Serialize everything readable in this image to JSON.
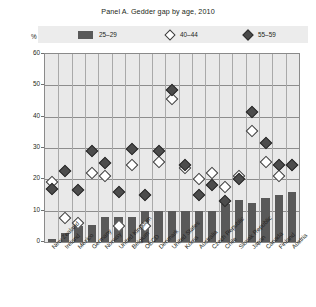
{
  "chart": {
    "title": "Panel A. Gedder gap by age, 2010",
    "unit_label": "%"
  },
  "legend": {
    "items": [
      {
        "label": "25–29",
        "marker": "filled-square",
        "color": "#595959"
      },
      {
        "label": "40–44",
        "marker": "open-diamond",
        "color": "#ffffff"
      },
      {
        "label": "55–59",
        "marker": "filled-diamond",
        "color": "#4c4c4c"
      }
    ]
  },
  "chart_data": {
    "type": "bar",
    "title": "Panel A. Gedder gap by age, 2010",
    "xlabel": "",
    "ylabel": "%",
    "ylim": [
      0,
      60
    ],
    "yticks": [
      0,
      10,
      20,
      30,
      40,
      50,
      60
    ],
    "grid": true,
    "legend_position": "top",
    "categories": [
      "New Zealand",
      "Ireland",
      "Mexico",
      "Germany",
      "Norway",
      "United Kingdom",
      "Belgium",
      "OECD",
      "Denmark",
      "United States",
      "Korea",
      "Australia",
      "Czech Republic",
      "Chile",
      "Slovak Republic",
      "Japan",
      "Canada",
      "Finland",
      "Austria"
    ],
    "series": [
      {
        "name": "25–29",
        "type": "bar",
        "color": "#595959",
        "values": [
          1,
          3,
          5,
          5.5,
          8,
          8,
          8,
          10,
          10,
          10,
          10,
          10,
          10,
          12,
          13.5,
          12.5,
          14,
          15,
          16
        ]
      },
      {
        "name": "40–44",
        "type": "scatter",
        "marker": "open-diamond",
        "color": "#ffffff",
        "values": [
          20.5,
          9,
          7.5,
          23.5,
          22.5,
          6.5,
          26,
          6.5,
          27,
          47,
          25,
          21.5,
          23.5,
          19,
          22.5,
          37,
          27,
          22.5,
          26
        ]
      },
      {
        "name": "55–59",
        "type": "scatter",
        "marker": "filled-diamond",
        "color": "#4c4c4c",
        "values": [
          18.5,
          24,
          18,
          30.5,
          26.5,
          17.5,
          31,
          16.5,
          30.5,
          50,
          26,
          16.5,
          19.5,
          14.5,
          21.5,
          43,
          33,
          26,
          26
        ]
      }
    ]
  }
}
